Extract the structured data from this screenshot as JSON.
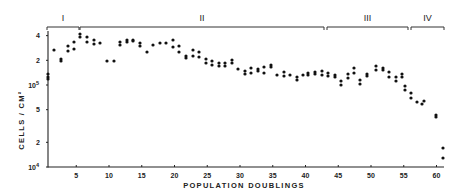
{
  "chart_data": {
    "type": "scatter",
    "title": "",
    "xlabel": "POPULATION DOUBLINGS",
    "ylabel": "CELLS / CM²",
    "yscale": "log",
    "xlim": [
      0.7,
      61.5
    ],
    "ylim": [
      10000,
      400000
    ],
    "grid": false,
    "legend": null,
    "x_ticks": [
      5,
      10,
      15,
      20,
      25,
      30,
      35,
      40,
      45,
      50,
      55,
      60
    ],
    "y_ticks": [
      {
        "value": 10000,
        "label": "10",
        "sup": "4"
      },
      {
        "value": 20000,
        "label": "2",
        "sup": ""
      },
      {
        "value": 50000,
        "label": "5",
        "sup": ""
      },
      {
        "value": 100000,
        "label": "10",
        "sup": "5"
      },
      {
        "value": 200000,
        "label": "2",
        "sup": ""
      },
      {
        "value": 400000,
        "label": "4",
        "sup": ""
      }
    ],
    "phases": [
      {
        "label": "I",
        "from": 0.7,
        "to": 6.0
      },
      {
        "label": "II",
        "from": 6.0,
        "to": 43.5
      },
      {
        "label": "III",
        "from": 43.5,
        "to": 55.8
      },
      {
        "label": "IV",
        "from": 55.8,
        "to": 61.3
      }
    ],
    "points": [
      [
        1,
        140000
      ],
      [
        1,
        128000
      ],
      [
        1,
        120000
      ],
      [
        2,
        275000
      ],
      [
        3,
        210000
      ],
      [
        3,
        195000
      ],
      [
        4,
        300000
      ],
      [
        4,
        255000
      ],
      [
        5,
        340000
      ],
      [
        5,
        275000
      ],
      [
        6,
        420000
      ],
      [
        6,
        390000
      ],
      [
        7,
        380000
      ],
      [
        7,
        330000
      ],
      [
        8,
        345000
      ],
      [
        8,
        305000
      ],
      [
        9,
        310000
      ],
      [
        10,
        190000
      ],
      [
        11,
        190000
      ],
      [
        12,
        315000
      ],
      [
        12,
        290000
      ],
      [
        13,
        335000
      ],
      [
        13,
        310000
      ],
      [
        14,
        340000
      ],
      [
        14,
        320000
      ],
      [
        15,
        305000
      ],
      [
        15,
        280000
      ],
      [
        16,
        245000
      ],
      [
        17,
        300000
      ],
      [
        18,
        325000
      ],
      [
        19,
        325000
      ],
      [
        20,
        350000
      ],
      [
        20,
        280000
      ],
      [
        21,
        285000
      ],
      [
        21,
        240000
      ],
      [
        22,
        215000
      ],
      [
        22,
        195000
      ],
      [
        23,
        255000
      ],
      [
        23,
        215000
      ],
      [
        24,
        240000
      ],
      [
        24,
        210000
      ],
      [
        25,
        190000
      ],
      [
        25,
        165000
      ],
      [
        26,
        175000
      ],
      [
        26,
        160000
      ],
      [
        27,
        165000
      ],
      [
        27,
        150000
      ],
      [
        28,
        165000
      ],
      [
        28,
        150000
      ],
      [
        29,
        185000
      ],
      [
        29,
        170000
      ],
      [
        30,
        140000
      ],
      [
        31,
        135000
      ],
      [
        31,
        125000
      ],
      [
        32,
        150000
      ],
      [
        32,
        128000
      ],
      [
        33,
        145000
      ],
      [
        33,
        135000
      ],
      [
        34,
        155000
      ],
      [
        34,
        128000
      ],
      [
        35,
        170000
      ],
      [
        35,
        160000
      ],
      [
        36,
        125000
      ],
      [
        37,
        128000
      ],
      [
        37,
        115000
      ],
      [
        38,
        110000
      ],
      [
        38,
        102000
      ],
      [
        39,
        123000
      ],
      [
        40,
        128000
      ],
      [
        40,
        120000
      ],
      [
        41,
        135000
      ],
      [
        41,
        128000
      ],
      [
        42,
        140000
      ],
      [
        42,
        122000
      ],
      [
        43,
        140000
      ],
      [
        43,
        128000
      ],
      [
        44,
        128000
      ],
      [
        44,
        120000
      ],
      [
        45,
        120000
      ],
      [
        45,
        108000
      ],
      [
        46,
        128000
      ],
      [
        46,
        118000
      ],
      [
        47,
        105000
      ],
      [
        47,
        98000
      ],
      [
        48,
        132000
      ],
      [
        48,
        122000
      ],
      [
        49,
        160000
      ],
      [
        49,
        135000
      ],
      [
        50,
        105000
      ],
      [
        50,
        98000
      ],
      [
        51,
        135000
      ],
      [
        52,
        133000
      ],
      [
        52,
        128000
      ],
      [
        53,
        160000
      ],
      [
        53,
        150000
      ],
      [
        54,
        152000
      ],
      [
        54,
        146000
      ],
      [
        55,
        142000
      ],
      [
        55,
        132000
      ],
      [
        56,
        138000
      ],
      [
        56,
        128000
      ],
      [
        57,
        132000
      ],
      [
        57,
        120000
      ],
      [
        58,
        125000
      ],
      [
        59,
        112000
      ],
      [
        59,
        105000
      ],
      [
        60,
        118000
      ],
      [
        60,
        108000
      ],
      [
        61,
        110000
      ],
      [
        61,
        100000
      ],
      [
        62,
        90000
      ],
      [
        62,
        80000
      ],
      [
        63,
        72000
      ],
      [
        63,
        65000
      ],
      [
        64,
        55000
      ],
      [
        65,
        58000
      ],
      [
        66,
        42000
      ],
      [
        66,
        40000
      ],
      [
        67,
        16000
      ],
      [
        67,
        12500
      ]
    ],
    "px_points": [
      [
        48,
        74
      ],
      [
        48,
        77
      ],
      [
        48,
        79
      ],
      [
        54,
        50
      ],
      [
        61,
        59
      ],
      [
        61,
        61
      ],
      [
        68,
        46
      ],
      [
        68,
        51
      ],
      [
        74,
        42
      ],
      [
        74,
        49
      ],
      [
        80,
        34
      ],
      [
        80,
        37
      ],
      [
        87,
        37
      ],
      [
        87,
        42
      ],
      [
        94,
        40
      ],
      [
        94,
        44
      ],
      [
        100,
        43
      ],
      [
        107,
        61
      ],
      [
        114,
        61
      ],
      [
        120,
        42
      ],
      [
        120,
        45
      ],
      [
        127,
        40
      ],
      [
        127,
        42
      ],
      [
        133,
        40
      ],
      [
        133,
        41
      ],
      [
        140,
        43
      ],
      [
        140,
        46
      ],
      [
        147,
        52
      ],
      [
        153,
        45
      ],
      [
        160,
        43
      ],
      [
        166,
        43
      ],
      [
        173,
        40
      ],
      [
        173,
        47
      ],
      [
        179,
        46
      ],
      [
        179,
        52
      ],
      [
        186,
        56
      ],
      [
        186,
        58
      ],
      [
        193,
        50
      ],
      [
        193,
        56
      ],
      [
        199,
        52
      ],
      [
        199,
        57
      ],
      [
        206,
        59
      ],
      [
        206,
        63
      ],
      [
        212,
        61
      ],
      [
        212,
        65
      ],
      [
        219,
        63
      ],
      [
        219,
        66
      ],
      [
        225,
        63
      ],
      [
        225,
        66
      ],
      [
        232,
        60
      ],
      [
        232,
        63
      ],
      [
        238,
        69
      ],
      [
        245,
        71
      ],
      [
        245,
        74
      ],
      [
        251,
        68
      ],
      [
        251,
        73
      ],
      [
        258,
        69
      ],
      [
        258,
        71
      ],
      [
        264,
        67
      ],
      [
        264,
        73
      ],
      [
        271,
        65
      ],
      [
        271,
        67
      ],
      [
        277,
        75
      ],
      [
        284,
        72
      ],
      [
        284,
        76
      ],
      [
        290,
        75
      ],
      [
        297,
        77
      ],
      [
        297,
        80
      ],
      [
        303,
        75
      ],
      [
        308,
        73
      ],
      [
        308,
        75
      ],
      [
        315,
        72
      ],
      [
        315,
        74
      ],
      [
        322,
        71
      ],
      [
        322,
        75
      ],
      [
        328,
        73
      ],
      [
        328,
        76
      ],
      [
        335,
        75
      ],
      [
        335,
        77
      ],
      [
        341,
        81
      ],
      [
        341,
        85
      ],
      [
        348,
        74
      ],
      [
        348,
        78
      ],
      [
        354,
        68
      ],
      [
        354,
        73
      ],
      [
        360,
        80
      ],
      [
        360,
        84
      ],
      [
        367,
        74
      ],
      [
        367,
        76
      ],
      [
        376,
        66
      ],
      [
        376,
        70
      ],
      [
        383,
        68
      ],
      [
        383,
        70
      ],
      [
        389,
        72
      ],
      [
        389,
        77
      ],
      [
        396,
        77
      ],
      [
        396,
        81
      ],
      [
        402,
        74
      ],
      [
        402,
        77
      ],
      [
        405,
        86
      ],
      [
        405,
        90
      ],
      [
        411,
        93
      ],
      [
        411,
        98
      ],
      [
        417,
        102
      ],
      [
        422,
        104
      ],
      [
        424,
        101
      ],
      [
        436,
        115
      ],
      [
        436,
        117
      ],
      [
        443,
        148
      ],
      [
        443,
        158
      ]
    ]
  }
}
